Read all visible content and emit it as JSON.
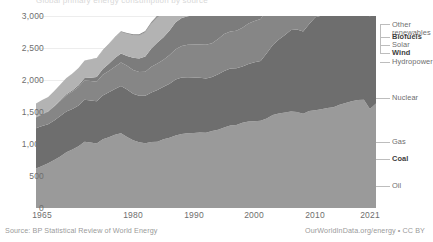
{
  "title_clipped": "Global primary energy consumption by source",
  "footer": {
    "source": "Source: BP Statistical Review of World Energy",
    "attribution": "OurWorldInData.org/energy • CC BY"
  },
  "axes": {
    "y_ticks": [
      "0",
      "500",
      "1,000",
      "1,500",
      "2,000",
      "2,500",
      "3,000"
    ],
    "x_ticks": [
      "1965",
      "1980",
      "1990",
      "2000",
      "2010",
      "2021"
    ]
  },
  "legend": [
    {
      "label": "Other renewables",
      "bold": false
    },
    {
      "label": "Biofuels",
      "bold": true
    },
    {
      "label": "Solar",
      "bold": false
    },
    {
      "label": "Wind",
      "bold": true
    },
    {
      "label": "Hydropower",
      "bold": false
    },
    {
      "label": "Nuclear",
      "bold": false
    },
    {
      "label": "Gas",
      "bold": false
    },
    {
      "label": "Coal",
      "bold": true
    },
    {
      "label": "Oil",
      "bold": false
    }
  ],
  "colors": {
    "oil": "#9a9a9a",
    "coal": "#6e6e6e",
    "gas": "#868686",
    "nuclear": "#7c7c7c",
    "hydropower": "#b3b3b3",
    "wind": "#5f5f5f",
    "solar": "#8e8e8e",
    "biofuels": "#707070",
    "other_renewables": "#8a8a8a",
    "gridline": "#ededed",
    "axis_text": "#6e6e6e",
    "footer_text": "#9a9a9a"
  },
  "chart_data": {
    "type": "area",
    "stacked": true,
    "title": "Global primary energy consumption by source",
    "xlabel": "",
    "ylabel": "",
    "unit": "TWh (implied)",
    "xlim": [
      1965,
      2021
    ],
    "ylim": [
      0,
      3200
    ],
    "grid": true,
    "legend_position": "right-direct-label",
    "x": [
      1965,
      1966,
      1967,
      1968,
      1969,
      1970,
      1971,
      1972,
      1973,
      1974,
      1975,
      1976,
      1977,
      1978,
      1979,
      1980,
      1981,
      1982,
      1983,
      1984,
      1985,
      1986,
      1987,
      1988,
      1989,
      1990,
      1991,
      1992,
      1993,
      1994,
      1995,
      1996,
      1997,
      1998,
      1999,
      2000,
      2001,
      2002,
      2003,
      2004,
      2005,
      2006,
      2007,
      2008,
      2009,
      2010,
      2011,
      2012,
      2013,
      2014,
      2015,
      2016,
      2017,
      2018,
      2019,
      2020,
      2021
    ],
    "series": [
      {
        "name": "Oil",
        "values": [
          660,
          700,
          745,
          800,
          860,
          930,
          975,
          1030,
          1105,
          1090,
          1075,
          1145,
          1180,
          1220,
          1245,
          1185,
          1130,
          1095,
          1080,
          1100,
          1105,
          1145,
          1170,
          1210,
          1235,
          1245,
          1250,
          1260,
          1255,
          1285,
          1305,
          1340,
          1375,
          1385,
          1420,
          1440,
          1445,
          1455,
          1490,
          1550,
          1575,
          1590,
          1610,
          1600,
          1570,
          1615,
          1630,
          1645,
          1665,
          1680,
          1720,
          1750,
          1780,
          1800,
          1805,
          1650,
          1740
        ]
      },
      {
        "name": "Coal",
        "values": [
          670,
          665,
          650,
          660,
          675,
          680,
          675,
          680,
          700,
          700,
          705,
          730,
          750,
          765,
          790,
          790,
          775,
          775,
          790,
          825,
          860,
          875,
          900,
          930,
          940,
          935,
          925,
          910,
          905,
          900,
          925,
          945,
          950,
          945,
          940,
          960,
          985,
          995,
          1090,
          1165,
          1235,
          1295,
          1355,
          1375,
          1370,
          1450,
          1550,
          1560,
          1590,
          1590,
          1565,
          1540,
          1560,
          1580,
          1570,
          1540,
          1620
        ]
      },
      {
        "name": "Gas",
        "values": [
          180,
          195,
          210,
          230,
          250,
          270,
          290,
          305,
          320,
          325,
          325,
          345,
          355,
          370,
          390,
          395,
          395,
          395,
          400,
          430,
          445,
          450,
          480,
          505,
          525,
          540,
          550,
          555,
          560,
          560,
          585,
          615,
          615,
          625,
          645,
          675,
          685,
          700,
          720,
          750,
          775,
          790,
          815,
          825,
          805,
          870,
          890,
          905,
          925,
          930,
          945,
          975,
          1010,
          1050,
          1075,
          1055,
          1100
        ]
      },
      {
        "name": "Nuclear",
        "values": [
          5,
          6,
          7,
          9,
          12,
          17,
          24,
          32,
          42,
          55,
          78,
          95,
          120,
          145,
          150,
          165,
          205,
          225,
          255,
          305,
          350,
          375,
          410,
          450,
          465,
          475,
          490,
          495,
          505,
          515,
          530,
          545,
          540,
          555,
          585,
          590,
          595,
          610,
          600,
          615,
          625,
          635,
          620,
          620,
          615,
          630,
          600,
          560,
          565,
          575,
          580,
          595,
          600,
          620,
          640,
          615,
          640
        ]
      },
      {
        "name": "Hydropower",
        "values": [
          225,
          235,
          240,
          250,
          260,
          270,
          275,
          285,
          290,
          305,
          310,
          310,
          325,
          340,
          355,
          365,
          370,
          380,
          400,
          410,
          415,
          420,
          425,
          440,
          440,
          455,
          465,
          465,
          480,
          490,
          500,
          510,
          510,
          520,
          530,
          545,
          535,
          545,
          560,
          575,
          590,
          610,
          615,
          635,
          650,
          680,
          695,
          720,
          740,
          755,
          760,
          775,
          790,
          810,
          815,
          820,
          835
        ]
      },
      {
        "name": "Wind",
        "values": [
          0,
          0,
          0,
          0,
          0,
          0,
          0,
          0,
          0,
          0,
          0,
          0,
          0,
          0,
          0,
          0,
          0,
          0,
          0,
          0,
          0,
          0,
          0,
          0,
          0,
          1,
          1,
          1,
          2,
          2,
          3,
          3,
          4,
          5,
          6,
          8,
          9,
          12,
          15,
          19,
          24,
          30,
          40,
          50,
          60,
          75,
          95,
          115,
          140,
          165,
          190,
          215,
          250,
          285,
          320,
          355,
          400
        ]
      },
      {
        "name": "Solar",
        "values": [
          0,
          0,
          0,
          0,
          0,
          0,
          0,
          0,
          0,
          0,
          0,
          0,
          0,
          0,
          0,
          0,
          0,
          0,
          0,
          0,
          0,
          0,
          0,
          0,
          0,
          0,
          0,
          0,
          0,
          0,
          0,
          0,
          0,
          0,
          0,
          0,
          0,
          0,
          0,
          1,
          1,
          2,
          3,
          5,
          8,
          12,
          20,
          30,
          40,
          55,
          70,
          90,
          120,
          155,
          195,
          235,
          290
        ]
      },
      {
        "name": "Biofuels",
        "values": [
          0,
          0,
          0,
          0,
          0,
          0,
          0,
          0,
          0,
          0,
          0,
          1,
          1,
          2,
          3,
          4,
          5,
          6,
          7,
          8,
          9,
          10,
          11,
          12,
          13,
          14,
          15,
          16,
          17,
          18,
          20,
          22,
          24,
          26,
          28,
          30,
          33,
          36,
          42,
          48,
          56,
          66,
          78,
          92,
          100,
          110,
          120,
          125,
          130,
          140,
          145,
          150,
          155,
          160,
          165,
          155,
          165
        ]
      },
      {
        "name": "Other renewables",
        "values": [
          0,
          0,
          0,
          0,
          0,
          1,
          1,
          2,
          3,
          4,
          5,
          6,
          8,
          10,
          12,
          14,
          16,
          18,
          20,
          23,
          26,
          29,
          33,
          37,
          41,
          45,
          48,
          52,
          56,
          60,
          64,
          68,
          72,
          76,
          80,
          85,
          90,
          95,
          100,
          106,
          112,
          118,
          126,
          134,
          140,
          150,
          160,
          170,
          180,
          192,
          204,
          218,
          232,
          248,
          262,
          272,
          290
        ]
      }
    ]
  }
}
